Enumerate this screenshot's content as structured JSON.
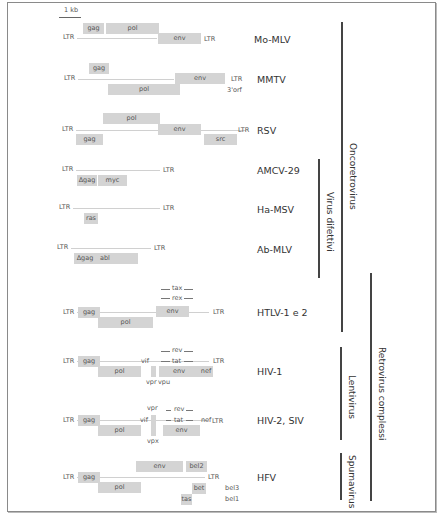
{
  "scale": {
    "label": "1 kb"
  },
  "viruses": [
    {
      "name": "Mo-MLV",
      "segments": [
        "LTR",
        "gag",
        "pol",
        "env",
        "LTR"
      ]
    },
    {
      "name": "MMTV",
      "segments": [
        "LTR",
        "gag",
        "pol",
        "env",
        "LTR",
        "3'orf"
      ]
    },
    {
      "name": "RSV",
      "segments": [
        "LTR",
        "pol",
        "gag",
        "env",
        "src",
        "LTR"
      ]
    },
    {
      "name": "AMCV-29",
      "segments": [
        "LTR",
        "Δgag",
        "myc",
        "LTR"
      ]
    },
    {
      "name": "Ha-MSV",
      "segments": [
        "LTR",
        "ras",
        "LTR"
      ]
    },
    {
      "name": "Ab-MLV",
      "segments": [
        "LTR",
        "Δgag",
        "abl",
        "LTR"
      ]
    },
    {
      "name": "HTLV-1 e 2",
      "segments": [
        "LTR",
        "gag",
        "pol",
        "tax",
        "rex",
        "env",
        "LTR"
      ]
    },
    {
      "name": "HIV-1",
      "segments": [
        "LTR",
        "gag",
        "pol",
        "vif",
        "vpr",
        "vpu",
        "rev",
        "tat",
        "env",
        "nef",
        "LTR"
      ]
    },
    {
      "name": "HIV-2, SIV",
      "segments": [
        "LTR",
        "gag",
        "pol",
        "vif",
        "vpr",
        "vpx",
        "rev",
        "tat",
        "env",
        "nef",
        "LTR"
      ]
    },
    {
      "name": "HFV",
      "segments": [
        "LTR",
        "gag",
        "pol",
        "env",
        "bel2",
        "bet",
        "tas",
        "LTR",
        "bel3",
        "bel1"
      ]
    }
  ],
  "groups": {
    "oncoretrovirus": "Oncoretrovirus",
    "virus_difettivi": "Virus difettivi",
    "retrovirus_complessi": "Retrovirus complessi",
    "lentivirus": "Lentivirus",
    "spumavirus": "Spumavirus"
  },
  "colors": {
    "gene_box": "#d4d4d4",
    "bracket": "#444444",
    "frame": "#8a8a8a"
  }
}
